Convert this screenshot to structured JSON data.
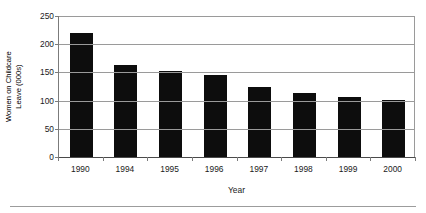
{
  "figure": {
    "clipped_text_above": "",
    "bottom_rule": "horizontal-rule"
  },
  "chart_data": {
    "type": "bar",
    "title": "",
    "categories": [
      "1990",
      "1994",
      "1995",
      "1996",
      "1997",
      "1998",
      "1999",
      "2000"
    ],
    "values": [
      220,
      163,
      152,
      145,
      124,
      113,
      107,
      101
    ],
    "xlabel": "Year",
    "ylabel": "Women on Childcare Leave (000s)",
    "ylabel_line1": "Women on Childcare",
    "ylabel_line2": "Leave (000s)",
    "ylim": [
      0,
      250
    ],
    "yticks": [
      0,
      50,
      100,
      150,
      200,
      250
    ],
    "ytick_labels": [
      "0",
      "50",
      "100",
      "150",
      "200",
      "250"
    ],
    "grid": true,
    "grid_axis": "y",
    "legend": false,
    "bar_color": "#0d0d0d",
    "grid_color": "#9a9a9a",
    "axis_color": "#7b7b7b",
    "background": "#ffffff"
  }
}
